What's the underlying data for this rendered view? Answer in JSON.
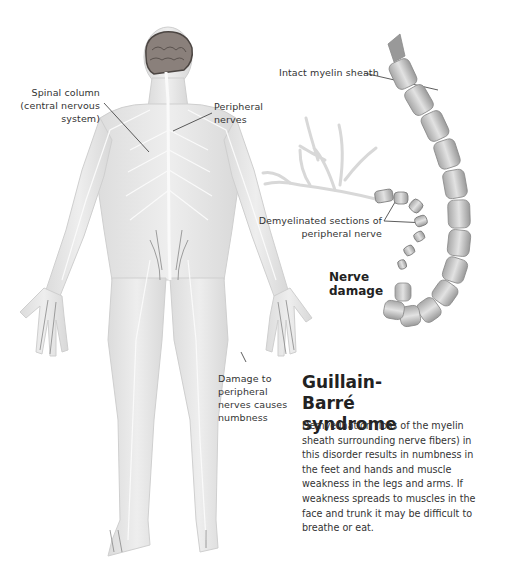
{
  "figure": {
    "title": "Guillain-Barré syndrome",
    "description": "Demyelination (loss of the myelin sheath surrounding nerve fibers) in this disorder results in numbness in the feet and hands and muscle weakness in the legs and arms. If weakness spreads to muscles in the face and trunk it may be difficult to breathe or eat.",
    "inset_heading": "Nerve damage",
    "labels": {
      "spinal_column": "Spinal column (central nervous system)",
      "spinal_column_l1": "Spinal column",
      "spinal_column_l2": "(central nervous",
      "spinal_column_l3": "system)",
      "peripheral_nerves_l1": "Peripheral",
      "peripheral_nerves_l2": "nerves",
      "intact_myelin": "Intact myelin sheath",
      "demyelinated_l1": "Demyelinated sections of",
      "demyelinated_l2": "peripheral nerve",
      "damage_l1": "Damage to",
      "damage_l2": "peripheral",
      "damage_l3": "nerves causes",
      "damage_l4": "numbness"
    },
    "colors": {
      "background": "#ffffff",
      "body_fill": "#e9e9e9",
      "nerve": "#f8f8f8",
      "brain": "#7a6f6a",
      "text": "#2a2a2a",
      "myelin": "#c9c9c9"
    }
  }
}
